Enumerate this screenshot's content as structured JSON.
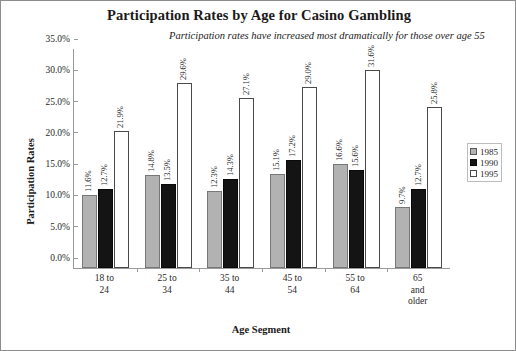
{
  "chart_data": {
    "type": "bar",
    "title": "Participation Rates by Age for Casino Gambling",
    "subtitle": "Participation rates have increased most dramatically for those over age 55",
    "xlabel": "Age Segment",
    "ylabel": "Participation Rates",
    "ylim": [
      0,
      35
    ],
    "ytick_labels": [
      "0.0%",
      "5.0%",
      "10.0%",
      "15.0%",
      "20.0%",
      "25.0%",
      "30.0%",
      "35.0%"
    ],
    "ytick_values": [
      0,
      5,
      10,
      15,
      20,
      25,
      30,
      35
    ],
    "grid": false,
    "legend_position": "right",
    "categories": [
      "18 to 24",
      "25 to 34",
      "35 to 44",
      "45 to 54",
      "55 to 64",
      "65 and older"
    ],
    "category_lines": [
      [
        "18 to",
        "24"
      ],
      [
        "25 to",
        "34"
      ],
      [
        "35 to",
        "44"
      ],
      [
        "45 to",
        "54"
      ],
      [
        "55 to",
        "64"
      ],
      [
        "65",
        "and",
        "older"
      ]
    ],
    "series": [
      {
        "name": "1985",
        "color": "#b2b2b2",
        "values": [
          11.6,
          14.8,
          12.3,
          15.1,
          16.6,
          9.7
        ],
        "labels": [
          "11.6%",
          "14.8%",
          "12.3%",
          "15.1%",
          "16.6%",
          "9.7%"
        ]
      },
      {
        "name": "1990",
        "color": "#141414",
        "values": [
          12.7,
          13.5,
          14.3,
          17.2,
          15.6,
          12.7
        ],
        "labels": [
          "12.7%",
          "13.5%",
          "14.3%",
          "17.2%",
          "15.6%",
          "12.7%"
        ]
      },
      {
        "name": "1995",
        "color": "#ffffff",
        "values": [
          21.9,
          29.6,
          27.1,
          29.0,
          31.6,
          25.8
        ],
        "labels": [
          "21.9%",
          "29.6%",
          "27.1%",
          "29.0%",
          "31.6%",
          "25.8%"
        ]
      }
    ]
  }
}
